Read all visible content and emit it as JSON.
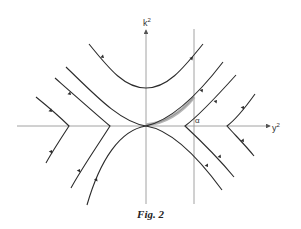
{
  "figure": {
    "caption": "Fig. 2",
    "axes": {
      "y_label": "k",
      "y_label_sup": "2",
      "x_label": "y",
      "x_label_sup": "2",
      "marker_label": "α"
    },
    "colors": {
      "curve": "#2b2b2b",
      "axis": "#8a8a8a",
      "shaded_band": "#b5b5b5"
    }
  }
}
